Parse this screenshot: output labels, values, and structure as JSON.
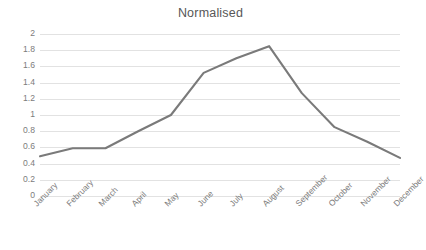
{
  "chart_data": {
    "type": "line",
    "title": "Normalised",
    "xlabel": "",
    "ylabel": "",
    "categories": [
      "January",
      "February",
      "March",
      "April",
      "May",
      "June",
      "July",
      "August",
      "September",
      "October",
      "November",
      "December"
    ],
    "values": [
      0.49,
      0.59,
      0.59,
      0.8,
      1.0,
      1.52,
      1.7,
      1.85,
      1.27,
      0.85,
      0.67,
      0.47
    ],
    "series": [
      {
        "name": "Normalised",
        "values": [
          0.49,
          0.59,
          0.59,
          0.8,
          1.0,
          1.52,
          1.7,
          1.85,
          1.27,
          0.85,
          0.67,
          0.47
        ]
      }
    ],
    "ylim": [
      0,
      2
    ],
    "ytick_step": 0.2,
    "ytick_labels": [
      "2",
      "1.8",
      "1.6",
      "1.4",
      "1.2",
      "1",
      "0.8",
      "0.6",
      "0.4",
      "0.2",
      "0"
    ],
    "ytick_values": [
      2,
      1.8,
      1.6,
      1.4,
      1.2,
      1,
      0.8,
      0.6,
      0.4,
      0.2,
      0
    ],
    "grid": true,
    "grid_axis": "y",
    "legend": false,
    "legend_position": "none",
    "xtick_rotation": -45,
    "line_color": "#7a7a7a",
    "grid_color": "#e2e2e2",
    "background_color": "#ffffff",
    "text_color": "#7c7c7c",
    "line_width": 2.1,
    "markers": false
  }
}
